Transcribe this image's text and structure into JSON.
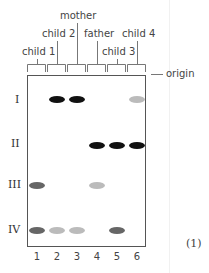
{
  "figure": {
    "number_label": "(1)",
    "origin_label": "origin",
    "lanes": [
      {
        "number": "1",
        "label": "child 1"
      },
      {
        "number": "2",
        "label": "child 2"
      },
      {
        "number": "3",
        "label": "mother"
      },
      {
        "number": "4",
        "label": "father"
      },
      {
        "number": "5",
        "label": "child 3"
      },
      {
        "number": "6",
        "label": "child 4"
      }
    ],
    "band_rows": [
      "I",
      "II",
      "III",
      "IV"
    ],
    "bands": [
      {
        "row": "I",
        "lane": 2,
        "intensity": "dark"
      },
      {
        "row": "I",
        "lane": 3,
        "intensity": "dark"
      },
      {
        "row": "I",
        "lane": 6,
        "intensity": "light"
      },
      {
        "row": "II",
        "lane": 4,
        "intensity": "dark"
      },
      {
        "row": "II",
        "lane": 5,
        "intensity": "dark"
      },
      {
        "row": "II",
        "lane": 6,
        "intensity": "dark"
      },
      {
        "row": "III",
        "lane": 1,
        "intensity": "medium"
      },
      {
        "row": "III",
        "lane": 4,
        "intensity": "light"
      },
      {
        "row": "IV",
        "lane": 1,
        "intensity": "medium"
      },
      {
        "row": "IV",
        "lane": 2,
        "intensity": "light"
      },
      {
        "row": "IV",
        "lane": 3,
        "intensity": "light"
      },
      {
        "row": "IV",
        "lane": 5,
        "intensity": "medium"
      }
    ],
    "colors": {
      "dark": "#111111",
      "medium": "#666666",
      "light": "#bbbbbb"
    }
  }
}
